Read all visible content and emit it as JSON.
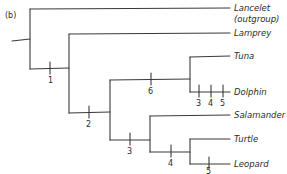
{
  "figure": {
    "panel_label": "(b)",
    "type": "cladogram"
  },
  "taxa": [
    {
      "name": "Lancelet",
      "sub": "(outgroup)"
    },
    {
      "name": "Lamprey"
    },
    {
      "name": "Tuna"
    },
    {
      "name": "Dolphin"
    },
    {
      "name": "Salamander"
    },
    {
      "name": "Turtle"
    },
    {
      "name": "Leopard"
    }
  ],
  "character_marks": [
    {
      "label": "1",
      "branch": "vertebrates (excluding Lancelet)"
    },
    {
      "label": "2",
      "branch": "jawed vertebrates"
    },
    {
      "label": "6",
      "branch": "Tuna + Dolphin"
    },
    {
      "label": "3",
      "branch": "Dolphin"
    },
    {
      "label": "4",
      "branch": "Dolphin"
    },
    {
      "label": "5",
      "branch": "Dolphin"
    },
    {
      "label": "3",
      "branch": "tetrapods"
    },
    {
      "label": "4",
      "branch": "amniotes"
    },
    {
      "label": "5",
      "branch": "Leopard"
    }
  ]
}
